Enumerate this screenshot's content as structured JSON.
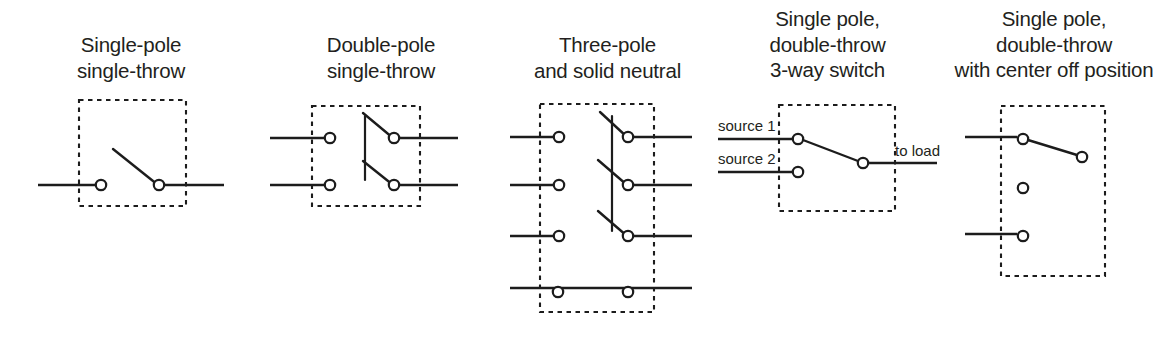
{
  "figure": {
    "background_color": "#ffffff",
    "line_color": "#1c1c1c",
    "text_color": "#231f20"
  },
  "panels": [
    {
      "id": "single-pole-single-throw",
      "caption_lines": [
        "Single-pole",
        "single-throw"
      ],
      "poles": 1,
      "throws": 1,
      "has_enclosure": true,
      "has_neutral": false,
      "lead_labels": []
    },
    {
      "id": "double-pole-single-throw",
      "caption_lines": [
        "Double-pole",
        "single-throw"
      ],
      "poles": 2,
      "throws": 1,
      "has_enclosure": true,
      "has_neutral": false,
      "lead_labels": []
    },
    {
      "id": "three-pole-and-solid-neutral",
      "caption_lines": [
        "Three-pole",
        "and solid neutral"
      ],
      "poles": 3,
      "throws": 1,
      "has_enclosure": true,
      "has_neutral": true,
      "lead_labels": []
    },
    {
      "id": "single-pole-double-throw-3-way",
      "caption_lines": [
        "Single pole,",
        "double-throw",
        "3-way switch"
      ],
      "poles": 1,
      "throws": 2,
      "has_enclosure": true,
      "has_neutral": false,
      "lead_labels": [
        {
          "id": "source-1",
          "text": "source 1"
        },
        {
          "id": "source-2",
          "text": "source 2"
        },
        {
          "id": "to-load",
          "text": "to load"
        }
      ]
    },
    {
      "id": "single-pole-double-throw-center-off",
      "caption_lines": [
        "Single pole,",
        "double-throw",
        "with center off position"
      ],
      "poles": 1,
      "throws": 2,
      "has_enclosure": true,
      "has_neutral": false,
      "has_center_off": true,
      "lead_labels": []
    }
  ]
}
